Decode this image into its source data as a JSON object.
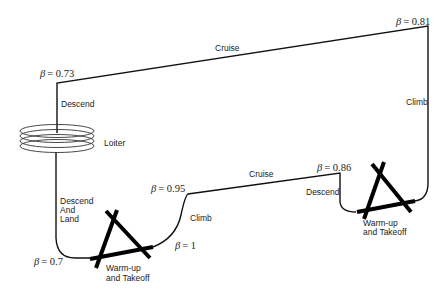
{
  "diagram": {
    "type": "mission-profile",
    "colors": {
      "line": "#111111",
      "text": "#222222",
      "background": "#ffffff"
    },
    "segments": [
      {
        "id": "warmup-takeoff-1",
        "label": "Warm-up\nand Takeoff"
      },
      {
        "id": "climb-1",
        "label": "Climb"
      },
      {
        "id": "cruise-1",
        "label": "Cruise"
      },
      {
        "id": "descend-1",
        "label": "Descend"
      },
      {
        "id": "warmup-takeoff-2",
        "label": "Warm-up\nand Takeoff"
      },
      {
        "id": "climb-2",
        "label": "Climb"
      },
      {
        "id": "cruise-2",
        "label": "Cruise"
      },
      {
        "id": "descend-2",
        "label": "Descend"
      },
      {
        "id": "loiter",
        "label": "Loiter"
      },
      {
        "id": "descend-land",
        "label": "Descend\nAnd\nLand"
      }
    ],
    "labels": {
      "cruise_top": "Cruise",
      "climb_right": "Climb",
      "descend_left": "Descend",
      "loiter": "Loiter",
      "descend_land": [
        "Descend",
        "And",
        "Land"
      ],
      "climb_mid": "Climb",
      "cruise_mid": "Cruise",
      "descend_mid": "Descend",
      "takeoff_left": [
        "Warm-up",
        "and Takeoff"
      ],
      "takeoff_right": [
        "Warm-up",
        "and Takeoff"
      ]
    },
    "beta_labels": {
      "symbol": "β",
      "b073": "= 0.73",
      "b081": "= 0.81",
      "b095": "= 0.95",
      "b086": "= 0.86",
      "b1": "= 1",
      "b07": "= 0.7"
    }
  }
}
